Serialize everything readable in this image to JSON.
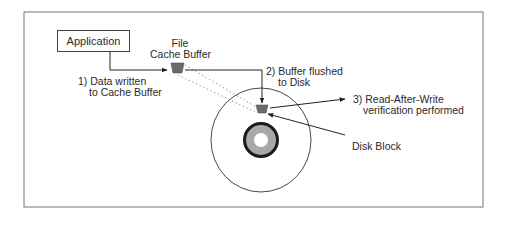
{
  "diagram": {
    "nodes": {
      "application": "Application",
      "file_cache_buffer": [
        "File",
        "Cache Buffer"
      ],
      "disk_block": "Disk Block"
    },
    "steps": [
      {
        "number": "1)",
        "lines": [
          "1) Data written",
          "to Cache Buffer"
        ]
      },
      {
        "number": "2)",
        "lines": [
          "2) Buffer flushed",
          "to Disk"
        ]
      },
      {
        "number": "3)",
        "lines": [
          "3) Read-After-Write",
          "verification performed"
        ]
      }
    ],
    "colors": {
      "frame": "#666666",
      "line": "#333333",
      "buffer_fill": "#6b6b6b",
      "hub_ring": "#1a1a1a",
      "hub_grey": "#a8a8a8"
    }
  }
}
